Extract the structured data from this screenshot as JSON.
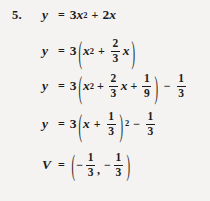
{
  "page": {
    "background_color": "#f4f3f1",
    "ink_color": "#1c1c1c",
    "problem_number": "5."
  },
  "solution": {
    "steps": [
      {
        "id": "step-1",
        "lhs": "y",
        "equals": "=",
        "plain": "y = 3x^2 + 2x",
        "tokens": {
          "coef": "3",
          "var": "x",
          "exp": "2",
          "op": "+",
          "term2_coef": "2",
          "term2_var": "x"
        }
      },
      {
        "id": "step-2",
        "lhs": "y",
        "equals": "=",
        "plain": "y = 3(x^2 + (2/3)x)",
        "tokens": {
          "coef": "3",
          "open_paren": "(",
          "close_paren": ")",
          "var": "x",
          "exp": "2",
          "op": "+",
          "frac_num": "2",
          "frac_den": "3",
          "frac_var": "x"
        }
      },
      {
        "id": "step-3",
        "lhs": "y",
        "equals": "=",
        "plain": "y = 3(x^2 + (2/3)x + 1/9) - 1/3",
        "tokens": {
          "coef": "3",
          "open_paren": "(",
          "close_paren": ")",
          "var": "x",
          "exp": "2",
          "op1": "+",
          "frac1_num": "2",
          "frac1_den": "3",
          "frac1_var": "x",
          "op2": "+",
          "frac2_num": "1",
          "frac2_den": "9",
          "op3": "−",
          "frac3_num": "1",
          "frac3_den": "3"
        }
      },
      {
        "id": "step-4",
        "lhs": "y",
        "equals": "=",
        "plain": "y = 3(x + 1/3)^2 - 1/3",
        "tokens": {
          "coef": "3",
          "open_paren": "(",
          "close_paren": ")",
          "var": "x",
          "op1": "+",
          "frac1_num": "1",
          "frac1_den": "3",
          "paren_exp": "2",
          "op2": "−",
          "frac2_num": "1",
          "frac2_den": "3"
        }
      },
      {
        "id": "step-5",
        "lhs": "V",
        "equals": "=",
        "plain": "V = (-1/3, -1/3)",
        "tokens": {
          "open_paren": "(",
          "close_paren": ")",
          "neg1": "−",
          "frac1_num": "1",
          "frac1_den": "3",
          "comma": ",",
          "neg2": "−",
          "frac2_num": "1",
          "frac2_den": "3"
        }
      }
    ]
  }
}
